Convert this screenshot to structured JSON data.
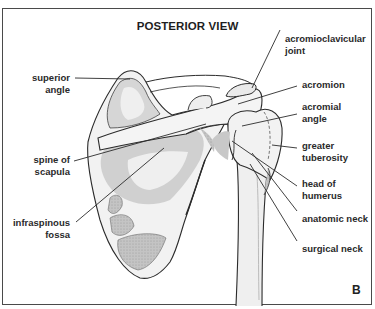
{
  "figure": {
    "title": "POSTERIOR VIEW",
    "panel_label": "B",
    "labels": {
      "acromioclavicular_joint": [
        "acromioclavicular",
        "joint"
      ],
      "superior_angle": [
        "superior",
        "angle"
      ],
      "acromion": [
        "acromion"
      ],
      "acromial_angle": [
        "acromial",
        "angle"
      ],
      "spine_of_scapula": [
        "spine of",
        "scapula"
      ],
      "greater_tuberosity": [
        "greater",
        "tuberosity"
      ],
      "head_of_humerus": [
        "head of",
        "humerus"
      ],
      "infraspinous_fossa": [
        "infraspinous",
        "fossa"
      ],
      "anatomic_neck": [
        "anatomic neck"
      ],
      "surgical_neck": [
        "surgical neck"
      ]
    },
    "colors": {
      "outline": "#2b2b2b",
      "bone_fill": "#f2f2f2",
      "shade_light": "#dcdcdc",
      "shade_dark": "#b9b9b9",
      "frame": "#4a4a4a"
    }
  }
}
